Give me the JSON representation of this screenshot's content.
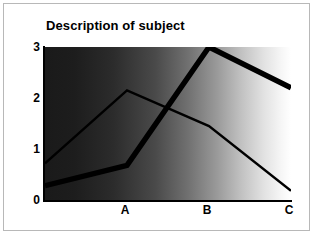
{
  "card": {
    "border_color": "#b8b8b8",
    "background": "#ffffff"
  },
  "chart_data": {
    "type": "line",
    "title": "Description of subject",
    "xlabel": "",
    "ylabel": "",
    "categories": [
      "A",
      "B",
      "C"
    ],
    "x_tick_labels": [
      "A",
      "B",
      "C"
    ],
    "y_tick_labels": [
      "3",
      "2",
      "1",
      "0"
    ],
    "ylim": [
      0,
      3
    ],
    "yticks": [
      0,
      1,
      2,
      3
    ],
    "grid": false,
    "legend": "none",
    "plot_background": "horizontal gradient black to white",
    "plot_bg_start_color": "#1a1a1a",
    "plot_bg_end_color": "#ffffff",
    "series": [
      {
        "name": "thick-series",
        "style": "thick",
        "color": "#000000",
        "line_width": 5,
        "x": [
          0.0,
          1.0,
          2.0,
          3.0
        ],
        "values": [
          0.28,
          0.68,
          3.0,
          2.2
        ]
      },
      {
        "name": "thin-series",
        "style": "thin",
        "color": "#000000",
        "line_width": 2,
        "x": [
          0.0,
          1.0,
          2.0,
          3.0
        ],
        "values": [
          0.72,
          2.15,
          1.45,
          0.18
        ]
      }
    ],
    "axis": {
      "x_axis_color": "#000000",
      "y_axis_color": "#000000"
    }
  },
  "ytick_positions_px": [
    43,
    94,
    145,
    196
  ],
  "xtick_positions_px": [
    121,
    203,
    285
  ]
}
